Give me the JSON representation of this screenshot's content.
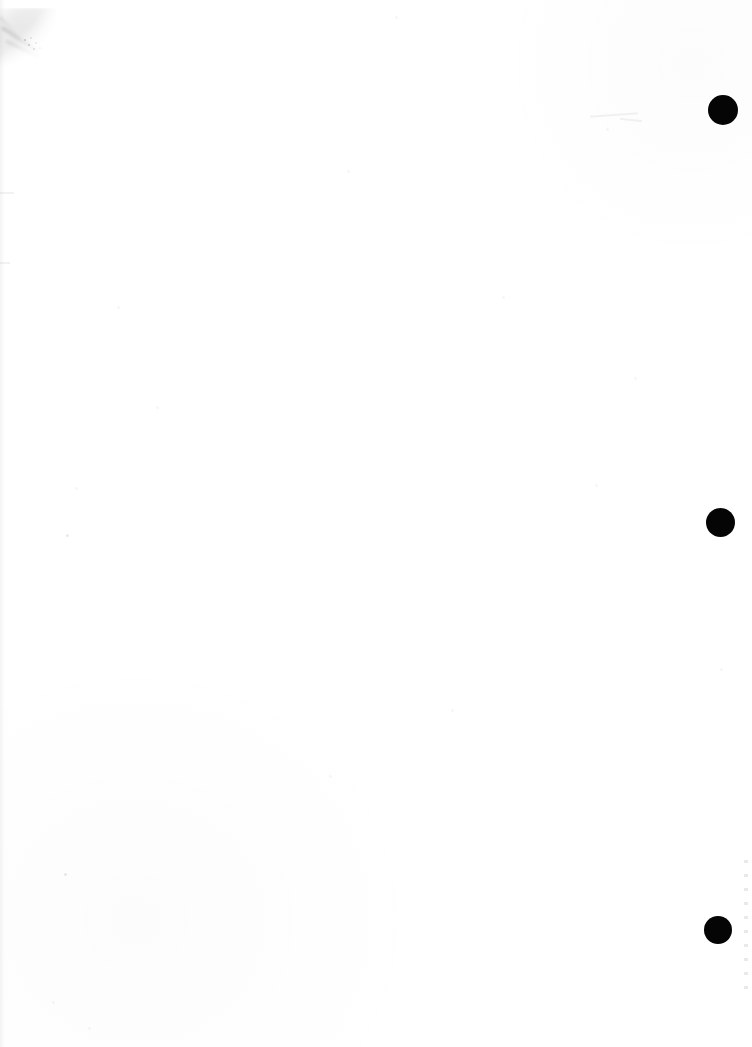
{
  "document": {
    "kind": "scanned-page",
    "page_label": "",
    "background_color": "#ffffff",
    "ink_color": "#050505",
    "width": 752,
    "height": 1047,
    "visible_text": "",
    "note": ""
  },
  "marks": {
    "registration_dots": [
      {
        "name": "registration-dot-top",
        "cx": 723,
        "cy": 110,
        "diameter": 30,
        "color": "#050505"
      },
      {
        "name": "registration-dot-middle",
        "cx": 720,
        "cy": 522,
        "diameter": 29,
        "color": "#050505"
      },
      {
        "name": "registration-dot-bottom",
        "cx": 718,
        "cy": 930,
        "diameter": 28,
        "color": "#050505"
      }
    ],
    "smudge": {
      "name": "corner-smudge",
      "location": "top-left",
      "color": "#d8d8d8"
    },
    "flecks": [
      {
        "x": 117,
        "y": 306,
        "size": 3,
        "tone": "light"
      },
      {
        "x": 156,
        "y": 406,
        "size": 3,
        "tone": "light"
      },
      {
        "x": 75,
        "y": 487,
        "size": 3,
        "tone": "light"
      },
      {
        "x": 66,
        "y": 534,
        "size": 3,
        "tone": "dark"
      },
      {
        "x": 64,
        "y": 873,
        "size": 3,
        "tone": "dark"
      },
      {
        "x": 52,
        "y": 1001,
        "size": 3,
        "tone": "light"
      },
      {
        "x": 88,
        "y": 1027,
        "size": 3,
        "tone": "light"
      },
      {
        "x": 329,
        "y": 775,
        "size": 3,
        "tone": "light"
      },
      {
        "x": 347,
        "y": 170,
        "size": 3,
        "tone": "light"
      },
      {
        "x": 395,
        "y": 16,
        "size": 3,
        "tone": "light"
      },
      {
        "x": 451,
        "y": 709,
        "size": 3,
        "tone": "light"
      },
      {
        "x": 502,
        "y": 296,
        "size": 3,
        "tone": "light"
      },
      {
        "x": 595,
        "y": 484,
        "size": 3,
        "tone": "light"
      },
      {
        "x": 634,
        "y": 377,
        "size": 3,
        "tone": "light"
      },
      {
        "x": 720,
        "y": 668,
        "size": 3,
        "tone": "light"
      },
      {
        "x": 606,
        "y": 128,
        "size": 3,
        "tone": "light"
      }
    ],
    "hairlines": [
      {
        "x": 590,
        "y": 114,
        "width": 48,
        "height": 2,
        "rotate": -4
      },
      {
        "x": 620,
        "y": 119,
        "width": 22,
        "height": 2,
        "rotate": 6
      },
      {
        "x": 0,
        "y": 192,
        "width": 14,
        "height": 2,
        "rotate": 0
      },
      {
        "x": 0,
        "y": 262,
        "width": 10,
        "height": 2,
        "rotate": 0
      }
    ],
    "edge_dots": {
      "name": "right-edge-dot-run",
      "from_y": 860,
      "to_y": 995
    }
  }
}
